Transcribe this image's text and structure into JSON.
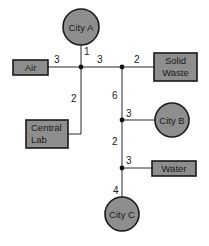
{
  "diagram": {
    "type": "network",
    "nodes": {
      "city_a": {
        "label": "City A",
        "shape": "circle"
      },
      "city_b": {
        "label": "City B",
        "shape": "circle"
      },
      "city_c": {
        "label": "City C",
        "shape": "circle"
      },
      "air": {
        "label": "Air",
        "shape": "box"
      },
      "solid_waste": {
        "label_line1": "Solid",
        "label_line2": "Waste",
        "shape": "box"
      },
      "central_lab": {
        "label_line1": "Central",
        "label_line2": "Lab",
        "shape": "box"
      },
      "water": {
        "label": "Water",
        "shape": "box"
      }
    },
    "edges": {
      "city_a_j1": "1",
      "air_j1": "3",
      "j1_j2": "3",
      "j2_solid_waste": "2",
      "j1_central_lab": "2",
      "j2_j3": "6",
      "j3_city_b": "3",
      "j3_j4": "2",
      "j4_water": "3",
      "j4_city_c": "4"
    },
    "colors": {
      "node_fill": "#8e8e8e",
      "node_stroke": "#1a1a1a",
      "line": "#2a2a2a"
    }
  }
}
